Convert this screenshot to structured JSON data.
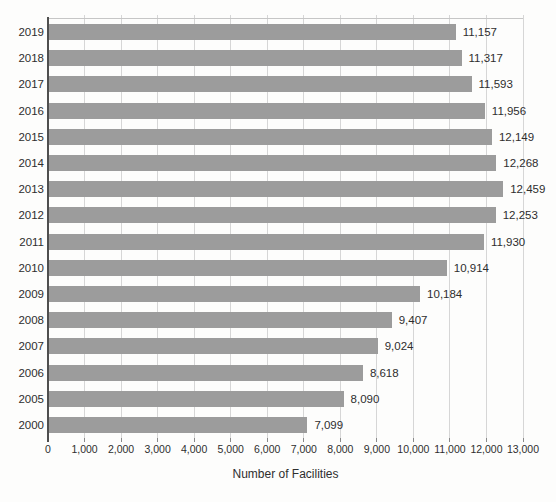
{
  "chart_data": {
    "type": "bar",
    "orientation": "horizontal",
    "title": "",
    "xlabel": "Number of Facilities",
    "ylabel": "",
    "categories": [
      "2019",
      "2018",
      "2017",
      "2016",
      "2015",
      "2014",
      "2013",
      "2012",
      "2011",
      "2010",
      "2009",
      "2008",
      "2007",
      "2006",
      "2005",
      "2000"
    ],
    "values": [
      11157,
      11317,
      11593,
      11956,
      12149,
      12268,
      12459,
      12253,
      11930,
      10914,
      10184,
      9407,
      9024,
      8618,
      8090,
      7099
    ],
    "value_labels": [
      "11,157",
      "11,317",
      "11,593",
      "11,956",
      "12,149",
      "12,268",
      "12,459",
      "12,253",
      "11,930",
      "10,914",
      "10,184",
      "9,407",
      "9,024",
      "8,618",
      "8,090",
      "7,099"
    ],
    "xlim": [
      0,
      13000
    ],
    "xticks": [
      0,
      1000,
      2000,
      3000,
      4000,
      5000,
      6000,
      7000,
      8000,
      9000,
      10000,
      11000,
      12000,
      13000
    ],
    "xtick_labels": [
      "0",
      "1,000",
      "2,000",
      "3,000",
      "4,000",
      "5,000",
      "6,000",
      "7,000",
      "8,000",
      "9,000",
      "10,000",
      "11,000",
      "12,000",
      "13,000"
    ],
    "grid": true,
    "legend": "none",
    "colors": {
      "bar": "#9c9c9c",
      "gridline": "#d6d6d6",
      "top_border": "#c6c6c6",
      "y_axis_line": "#4f4f4f",
      "tick": "#8a8a8a",
      "text": "#2e2e2e",
      "background": "#fdfdfc"
    }
  }
}
